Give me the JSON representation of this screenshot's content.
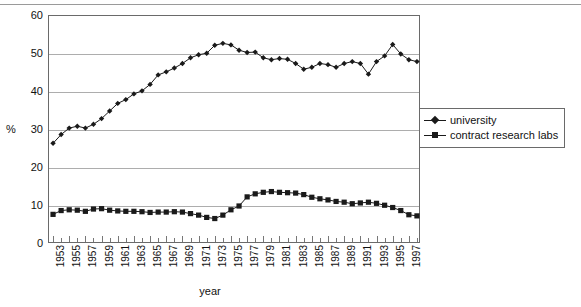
{
  "chart_data": {
    "type": "line",
    "title": "",
    "xlabel": "year",
    "ylabel": "%",
    "ylim": [
      0,
      60
    ],
    "yticks": [
      0,
      10,
      20,
      30,
      40,
      50,
      60
    ],
    "grid": true,
    "legend_position": "right",
    "x": [
      1953,
      1954,
      1955,
      1956,
      1957,
      1958,
      1959,
      1960,
      1961,
      1962,
      1963,
      1964,
      1965,
      1966,
      1967,
      1968,
      1969,
      1970,
      1971,
      1972,
      1973,
      1974,
      1975,
      1976,
      1977,
      1978,
      1979,
      1980,
      1981,
      1982,
      1983,
      1984,
      1985,
      1986,
      1987,
      1988,
      1989,
      1990,
      1991,
      1992,
      1993,
      1994,
      1995,
      1996,
      1997,
      1998
    ],
    "xtick_labels": [
      "1953",
      "1955",
      "1957",
      "1959",
      "1961",
      "1963",
      "1965",
      "1967",
      "1969",
      "1971",
      "1973",
      "1975",
      "1977",
      "1979",
      "1981",
      "1983",
      "1985",
      "1987",
      "1989",
      "1991",
      "1993",
      "1995",
      "1997"
    ],
    "series": [
      {
        "name": "university",
        "marker": "diamond",
        "values": [
          26.5,
          28.8,
          30.5,
          31.0,
          30.5,
          31.5,
          33.0,
          35.0,
          37.0,
          38.0,
          39.5,
          40.3,
          42.0,
          44.5,
          45.3,
          46.3,
          47.5,
          49.0,
          49.8,
          50.2,
          52.3,
          52.8,
          52.4,
          51.0,
          50.4,
          50.5,
          49.0,
          48.5,
          48.8,
          48.6,
          47.5,
          46.0,
          46.5,
          47.5,
          47.2,
          46.5,
          47.5,
          48.0,
          47.5,
          44.7,
          48.0,
          49.5,
          52.5,
          50.0,
          48.5,
          48.0
        ]
      },
      {
        "name": "contract research labs",
        "marker": "square",
        "values": [
          7.8,
          8.8,
          9.0,
          8.9,
          8.6,
          9.2,
          9.3,
          8.9,
          8.7,
          8.6,
          8.6,
          8.5,
          8.3,
          8.4,
          8.4,
          8.5,
          8.4,
          8.0,
          7.6,
          7.0,
          6.7,
          7.6,
          9.0,
          10.0,
          12.4,
          13.2,
          13.6,
          13.8,
          13.6,
          13.5,
          13.4,
          13.0,
          12.3,
          11.9,
          11.6,
          11.2,
          11.0,
          10.6,
          10.8,
          11.0,
          10.7,
          10.2,
          9.6,
          8.8,
          7.7,
          7.4
        ]
      }
    ]
  },
  "legend": {
    "items": [
      {
        "label": "university",
        "marker": "diamond"
      },
      {
        "label": "contract research labs",
        "marker": "square"
      }
    ]
  },
  "axes": {
    "y_unit_label": "%",
    "x_title": "year"
  },
  "colors": {
    "series_line": "#1a1a1a",
    "grid": "#adadad",
    "frame": "#6a6a6a",
    "background": "#ffffff"
  }
}
